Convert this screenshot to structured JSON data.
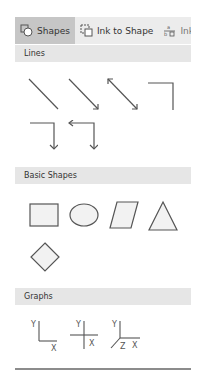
{
  "tabs": [
    {
      "label": "Shapes",
      "icon": "shapes-icon",
      "active": true
    },
    {
      "label": "Ink to Shape",
      "icon": "ink-to-shape-icon",
      "active": false
    },
    {
      "label": "Ink",
      "icon": "ink-math-icon",
      "active": false
    }
  ],
  "sections": {
    "lines": {
      "title": "Lines",
      "items": [
        "line",
        "arrow",
        "double-arrow",
        "elbow",
        "elbow-arrow",
        "elbow-double-arrow"
      ]
    },
    "basic_shapes": {
      "title": "Basic Shapes",
      "items": [
        "rectangle",
        "ellipse",
        "parallelogram",
        "triangle",
        "diamond"
      ]
    },
    "graphs": {
      "title": "Graphs",
      "items": [
        {
          "name": "xy-graph",
          "labels": [
            "Y",
            "X"
          ]
        },
        {
          "name": "xy-cross-graph",
          "labels": [
            "Y",
            "X"
          ]
        },
        {
          "name": "xyz-graph",
          "labels": [
            "Y",
            "Z",
            "X"
          ]
        }
      ]
    }
  },
  "colors": {
    "tab_bar_bg": "#ececec",
    "tab_active_bg": "#c6c6c6",
    "section_header_bg": "#e6e6e6",
    "stroke": "#555555",
    "shape_fill": "#f2f2f2"
  }
}
